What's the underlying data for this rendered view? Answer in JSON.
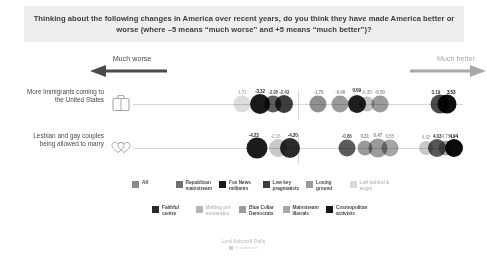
{
  "title": {
    "text": "Thinking about the following changes in America over recent years, do you think they have made America better or worse (where –5 means “much worse” and +5 means “much better”)?"
  },
  "axis": {
    "worse_label": "Much worse",
    "better_label": "Much better",
    "worse_arrow_icon": "left-arrow-icon",
    "better_arrow_icon": "right-arrow-icon",
    "min": -5,
    "max": 5,
    "zero": 0
  },
  "footer": {
    "credit": "Lord Ashcroft Polls",
    "mark_text": "@LordAshcroft",
    "mark_icon": "square-mark-icon"
  },
  "legend": {
    "rows": [
      [
        {
          "label": "All",
          "color": "#8a8a8a"
        },
        {
          "label": "Republican\nmainstream",
          "color": "#6e6e6e"
        },
        {
          "label": "Fox News\nmilitants",
          "color": "#1a1a1a"
        },
        {
          "label": "Low key\npragmatists",
          "color": "#3d3d3d"
        },
        {
          "label": "Losing\nground",
          "color": "#9b9b9b"
        },
        {
          "label": "Left behind &\nangry",
          "color": "#d9d9d9"
        }
      ],
      [
        {
          "label": "Faithful\ncentre",
          "color": "#2a2a2a"
        },
        {
          "label": "Melting pot\nmoderates",
          "color": "#b5b5b5"
        },
        {
          "label": "Blue Collar\nDemocrats",
          "color": "#9b9b9b"
        },
        {
          "label": "Mainstream\nliberals",
          "color": "#a8a8a8"
        },
        {
          "label": "Cosmopolitan\nactivists",
          "color": "#161616"
        }
      ]
    ]
  },
  "chart_data": {
    "type": "scatter",
    "title": "Thinking about the following changes in America over recent years, do you think they have made America better or worse (where –5 means “much worse” and +5 means “much better”)?",
    "xlabel": "",
    "ylabel": "",
    "xlim": [
      -5,
      5
    ],
    "grid": false,
    "legend_position": "bottom",
    "categories": [
      "More immigrants coming to the United States",
      "Lesbian and gay couples being allowed to marry"
    ],
    "series": [
      {
        "name": "All",
        "color": "#8a8a8a",
        "values": [
          -1.7,
          0.31
        ]
      },
      {
        "name": "Republican mainstream",
        "color": "#6e6e6e",
        "values": [
          -2.95,
          -0.86
        ]
      },
      {
        "name": "Fox News militants",
        "color": "#1a1a1a",
        "values": [
          -3.32,
          -4.23
        ]
      },
      {
        "name": "Low key pragmatists",
        "color": "#3d3d3d",
        "values": [
          -2.43,
          -2.15
        ]
      },
      {
        "name": "Losing ground",
        "color": "#9b9b9b",
        "values": [
          -0.4,
          0.47
        ]
      },
      {
        "name": "Left behind & angry",
        "color": "#d9d9d9",
        "values": [
          -1.71,
          -4.2
        ]
      },
      {
        "name": "Faithful centre",
        "color": "#2a2a2a",
        "values": [
          0.09,
          4.94
        ]
      },
      {
        "name": "Melting pot moderates",
        "color": "#b5b5b5",
        "values": [
          -0.35,
          0.55
        ]
      },
      {
        "name": "Blue Collar Democrats",
        "color": "#9b9b9b",
        "values": [
          -0.5,
          4.02
        ]
      },
      {
        "name": "Mainstream liberals",
        "color": "#a8a8a8",
        "values": [
          3.19,
          4.03
        ]
      },
      {
        "name": "Cosmopolitan activists",
        "color": "#161616",
        "values": [
          3.53,
          4.75
        ]
      }
    ]
  },
  "rows": [
    {
      "label": "More immigrants\ncoming to the United\nStates",
      "icon": "briefcase-icon",
      "points": [
        {
          "name": "left-behind-angry",
          "value": -1.71,
          "label": "-1.71",
          "x": -1.71,
          "size": 17,
          "color": "#dcdcdc",
          "label_color": "#b0b0b0",
          "label_dx": 0,
          "label_dy": -14
        },
        {
          "name": "fox-news-militants",
          "value": -3.32,
          "label": "-3.32",
          "x": -1.15,
          "size": 20,
          "color": "#1a1a1a",
          "label_color": "#2a2a2a",
          "label_dx": 0,
          "label_dy": -15
        },
        {
          "name": "republican-mainstream",
          "value": -2.95,
          "label": "-2.95",
          "x": -0.75,
          "size": 17,
          "color": "#5e5e5e",
          "label_color": "#555555",
          "label_dx": 0,
          "label_dy": -14
        },
        {
          "name": "low-key-pragmatists",
          "value": -2.43,
          "label": "-2.43",
          "x": -0.42,
          "size": 18,
          "color": "#3d3d3d",
          "label_color": "#555555",
          "label_dx": 0,
          "label_dy": -14
        },
        {
          "name": "all",
          "value": -1.7,
          "label": "-1.70",
          "x": 0.62,
          "size": 17,
          "color": "#8f8f8f",
          "label_color": "#8a8a8a",
          "label_dx": 0,
          "label_dy": -14
        },
        {
          "name": "losing-ground",
          "value": -0.4,
          "label": "-0.40",
          "x": 1.28,
          "size": 17,
          "color": "#9b9b9b",
          "label_color": "#8a8a8a",
          "label_dx": 0,
          "label_dy": -14
        },
        {
          "name": "faithful-centre",
          "value": 0.09,
          "label": "0.09",
          "x": 1.78,
          "size": 18,
          "color": "#1e1e1e",
          "label_color": "#2a2a2a",
          "label_dx": 0,
          "label_dy": -16
        },
        {
          "name": "melting-pot-moderates",
          "value": -0.35,
          "label": "-0.35",
          "x": 2.08,
          "size": 15,
          "color": "#bfbfbf",
          "label_color": "#a6a6a6",
          "label_dx": 0,
          "label_dy": -14
        },
        {
          "name": "blue-collar-democrats",
          "value": -0.5,
          "label": "-0.50",
          "x": 2.48,
          "size": 17,
          "color": "#9b9b9b",
          "label_color": "#8a8a8a",
          "label_dx": 0,
          "label_dy": -14
        },
        {
          "name": "mainstream-liberals",
          "value": 3.19,
          "label": "3.19",
          "x": 4.3,
          "size": 19,
          "color": "#4a4a4a",
          "label_color": "#3a3a3a",
          "label_dx": -4,
          "label_dy": -14
        },
        {
          "name": "cosmopolitan-activists",
          "value": 3.53,
          "label": "3.53",
          "x": 4.52,
          "size": 19,
          "color": "#0f0f0f",
          "label_color": "#111111",
          "label_dx": 4,
          "label_dy": -14
        }
      ]
    },
    {
      "label": "Lesbian and gay\ncouples being\nallowed to marry",
      "icon": "double-heart-icon",
      "points": [
        {
          "name": "fox-news-militants",
          "value": -4.23,
          "label": "-4.23",
          "x": -1.25,
          "size": 21,
          "color": "#1c1c1c",
          "label_color": "#2a2a2a",
          "label_dx": -3,
          "label_dy": -15
        },
        {
          "name": "low-key-pragmatists",
          "value": -2.15,
          "label": "-2.15",
          "x": -0.62,
          "size": 18,
          "color": "#c8c8c8",
          "label_color": "#b0b0b0",
          "label_dx": -2,
          "label_dy": -14
        },
        {
          "name": "left-behind-angry",
          "value": -4.2,
          "label": "-4.20",
          "x": -0.25,
          "size": 20,
          "color": "#2b2b2b",
          "label_color": "#2a2a2a",
          "label_dx": 3,
          "label_dy": -15
        },
        {
          "name": "republican-mainstream",
          "value": -0.86,
          "label": "-0.86",
          "x": 1.48,
          "size": 17,
          "color": "#5a5a5a",
          "label_color": "#555555",
          "label_dx": 0,
          "label_dy": -14
        },
        {
          "name": "all",
          "value": 0.31,
          "label": "0.31",
          "x": 2.02,
          "size": 15,
          "color": "#9a9a9a",
          "label_color": "#8a8a8a",
          "label_dx": 0,
          "label_dy": -14
        },
        {
          "name": "losing-ground",
          "value": 0.47,
          "label": "0.47",
          "x": 2.42,
          "size": 19,
          "color": "#9b9b9b",
          "label_color": "#8a8a8a",
          "label_dx": 0,
          "label_dy": -15
        },
        {
          "name": "melting-pot-moderates",
          "value": 0.55,
          "label": "0.55",
          "x": 2.78,
          "size": 17,
          "color": "#a5a5a5",
          "label_color": "#9a9a9a",
          "label_dx": 0,
          "label_dy": -14
        },
        {
          "name": "blue-collar-democrats",
          "value": 4.02,
          "label": "4.02",
          "x": 3.88,
          "size": 14,
          "color": "#c8c8c8",
          "label_color": "#b0b0b0",
          "label_dx": 0,
          "label_dy": -13
        },
        {
          "name": "mainstream-liberals",
          "value": 4.03,
          "label": "4.03",
          "x": 4.22,
          "size": 18,
          "color": "#585858",
          "label_color": "#3a3a3a",
          "label_dx": 0,
          "label_dy": -14
        },
        {
          "name": "faithful-centre",
          "value": 4.75,
          "label": "4.75",
          "x": 4.48,
          "size": 15,
          "color": "#a6a6a6",
          "label_color": "#9a9a9a",
          "label_dx": 0,
          "label_dy": -14
        },
        {
          "name": "cosmopolitan-activists",
          "value": 4.94,
          "label": "4.94",
          "x": 4.72,
          "size": 18,
          "color": "#0d0d0d",
          "label_color": "#111111",
          "label_dx": 0,
          "label_dy": -14
        }
      ]
    }
  ]
}
